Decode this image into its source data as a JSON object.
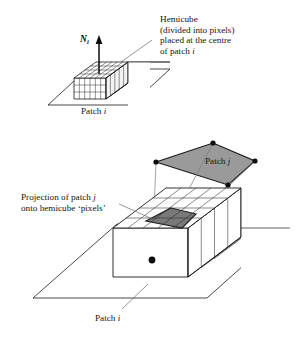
{
  "figure": {
    "background_color": "#ffffff",
    "line_color": "#1a1a1a",
    "patch_fill_color": "#9a9a9a",
    "projection_fill_color": "#6e6e6e",
    "box_face_color": "#ffffff"
  },
  "labels": {
    "hemicube": {
      "line1": "Hemicube",
      "line2": "(divided into pixels)",
      "line3": "placed at the centre",
      "line4_prefix": "of patch ",
      "line4_italic": "i"
    },
    "projection": {
      "line1_prefix": "Projection of patch ",
      "line1_italic": "j",
      "line2": "onto hemicube ‘pixels’"
    },
    "patch_i_top": {
      "prefix": "Patch ",
      "italic": "i"
    },
    "patch_i_bottom": {
      "prefix": "Patch ",
      "italic": "i"
    },
    "patch_j": {
      "prefix": "Patch ",
      "italic": "j"
    },
    "normal_vector": {
      "symbol": "N",
      "subscript": "i"
    }
  },
  "upper_diagram": {
    "plane_points": "48,105 87,69 170,69 131,105",
    "hemicube": {
      "top_face": "74,78 96,62 128,62 106,78",
      "front_face": "74,78 106,78 106,99 74,99",
      "side_face": "106,78 128,62 128,83 106,99",
      "top_grid_cols": 6,
      "top_grid_rows": 5,
      "front_grid_cols": 6,
      "front_grid_rows": 3,
      "side_grid_cols": 5,
      "side_grid_rows": 3
    },
    "normal_arrow": {
      "x": 99,
      "y_top": 38,
      "y_bottom": 74
    },
    "leader_line": "151,40 122,62"
  },
  "lower_diagram": {
    "plane_points": "33,298 117,224 290,224 207,298",
    "patch_j_quad": "213,143 255,161 228,185 156,162",
    "patch_j_vertices": [
      {
        "x": 213,
        "y": 143
      },
      {
        "x": 255,
        "y": 161
      },
      {
        "x": 228,
        "y": 185
      },
      {
        "x": 156,
        "y": 162
      }
    ],
    "hemicube": {
      "top_face": "113,228 166,188 241,188 188,228",
      "front_face": "113,228 188,228 188,277 113,277",
      "side_face": "188,228 241,188 241,237 188,277",
      "top_grid_cols": 5,
      "top_grid_rows": 4,
      "front_grid_cols": 5,
      "front_grid_rows": 3,
      "side_grid_cols": 4,
      "side_grid_rows": 3
    },
    "projection_quad": "171,208 196,214 182,228 146,221",
    "centre_point": {
      "x": 152,
      "y": 260
    },
    "projection_rays": [
      "213,143 152,260",
      "255,161 152,260",
      "228,185 152,260",
      "156,162 152,260"
    ],
    "leader_projection": "121,205 158,222",
    "leader_patch_i": "122,309 148,284"
  }
}
